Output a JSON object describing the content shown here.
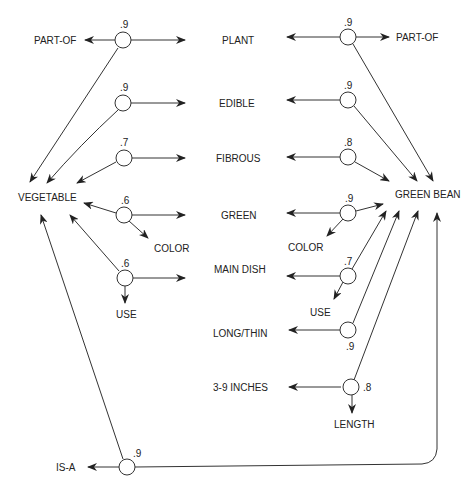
{
  "diagram": {
    "concepts": {
      "left": "VEGETABLE",
      "right": "GREEN BEAN"
    },
    "attributes": [
      "PLANT",
      "EDIBLE",
      "FIBROUS",
      "GREEN",
      "MAIN DISH",
      "LONG/THIN",
      "3-9 INCHES"
    ],
    "left_nodes": [
      {
        "weight": ".9",
        "relation": "PART-OF",
        "target": "PLANT"
      },
      {
        "weight": ".9",
        "relation": "",
        "target": "EDIBLE"
      },
      {
        "weight": ".7",
        "relation": "",
        "target": "FIBROUS"
      },
      {
        "weight": ".6",
        "relation": "COLOR",
        "target": "GREEN"
      },
      {
        "weight": ".6",
        "relation": "USE",
        "target": "MAIN DISH"
      }
    ],
    "right_nodes": [
      {
        "weight": ".9",
        "relation": "PART-OF",
        "target": "PLANT"
      },
      {
        "weight": ".9",
        "relation": "",
        "target": "EDIBLE"
      },
      {
        "weight": ".8",
        "relation": "",
        "target": "FIBROUS"
      },
      {
        "weight": ".9",
        "relation": "COLOR",
        "target": "GREEN"
      },
      {
        "weight": ".7",
        "relation": "USE",
        "target": "MAIN DISH"
      },
      {
        "weight": ".9",
        "relation": "",
        "target": "LONG/THIN"
      },
      {
        "weight": ".8",
        "relation": "LENGTH",
        "target": "3-9 INCHES"
      }
    ],
    "isa_node": {
      "weight": ".9",
      "relation": "IS-A",
      "from": "GREEN BEAN",
      "to": "VEGETABLE"
    }
  }
}
